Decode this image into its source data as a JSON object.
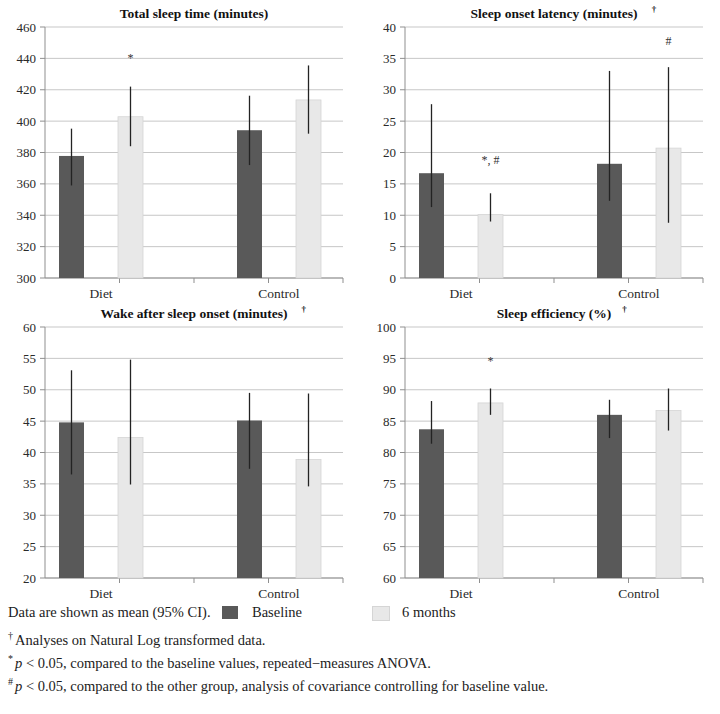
{
  "figure": {
    "colors": {
      "baseline": "#595959",
      "six_months": "#e8e8e8",
      "six_months_stroke": "#d5d5d5",
      "error_bar": "#232323",
      "gridline": "#b9b9b9"
    },
    "group_labels": [
      "Diet",
      "Control"
    ],
    "legend": {
      "lead_text": "Data are shown as mean (95% CI).",
      "baseline_label": "Baseline",
      "six_months_label": "6 months"
    },
    "notes": [
      {
        "marker": "†",
        "text": "Analyses on Natural Log transformed data."
      },
      {
        "marker": "*",
        "text": "p < 0.05, compared to the baseline values, repeated−measures ANOVA.",
        "italic_prefix": "p"
      },
      {
        "marker": "#",
        "text": "p < 0.05, compared to the other group, analysis of covariance controlling for baseline value.",
        "italic_prefix": "p"
      }
    ]
  },
  "chart_data": [
    {
      "type": "bar",
      "title": "Total sleep time (minutes)",
      "title_dagger": "",
      "xlabel": "",
      "ylabel": "",
      "ylim": [
        300,
        460
      ],
      "ytick_step": 20,
      "yticks": [
        300,
        320,
        340,
        360,
        380,
        400,
        420,
        440,
        460
      ],
      "grid": true,
      "categories": [
        "Diet",
        "Control"
      ],
      "series": [
        {
          "name": "Baseline",
          "values": [
            377.8,
            394.2
          ],
          "ci_low": [
            359.0,
            372.0
          ],
          "ci_high": [
            395.2,
            416.2
          ]
        },
        {
          "name": "6 months",
          "values": [
            402.8,
            413.5
          ],
          "ci_low": [
            384.0,
            392.0
          ],
          "ci_high": [
            422.0,
            435.5
          ]
        }
      ],
      "annotations": [
        {
          "series": "6 months",
          "category": "Diet",
          "text": "*",
          "y": 438
        }
      ]
    },
    {
      "type": "bar",
      "title": "Sleep onset latency (minutes)",
      "title_dagger": "†",
      "xlabel": "",
      "ylabel": "",
      "ylim": [
        0,
        40
      ],
      "ytick_step": 5,
      "yticks": [
        0,
        5,
        10,
        15,
        20,
        25,
        30,
        35,
        40
      ],
      "grid": true,
      "categories": [
        "Diet",
        "Control"
      ],
      "series": [
        {
          "name": "Baseline",
          "values": [
            16.7,
            18.2
          ],
          "ci_low": [
            11.3,
            12.3
          ],
          "ci_high": [
            27.7,
            33.0
          ]
        },
        {
          "name": "6 months",
          "values": [
            10.1,
            20.7
          ],
          "ci_low": [
            9.0,
            8.8
          ],
          "ci_high": [
            13.5,
            33.6
          ]
        }
      ],
      "annotations": [
        {
          "series": "6 months",
          "category": "Diet",
          "text": "*, #",
          "y": 18.2
        },
        {
          "series": "6 months",
          "category": "Control",
          "text": "#",
          "y": 37.2
        }
      ]
    },
    {
      "type": "bar",
      "title": "Wake after sleep onset (minutes)",
      "title_dagger": "†",
      "xlabel": "",
      "ylabel": "",
      "ylim": [
        20,
        60
      ],
      "ytick_step": 5,
      "yticks": [
        20,
        25,
        30,
        35,
        40,
        45,
        50,
        55,
        60
      ],
      "grid": true,
      "categories": [
        "Diet",
        "Control"
      ],
      "series": [
        {
          "name": "Baseline",
          "values": [
            44.8,
            45.1
          ],
          "ci_low": [
            36.5,
            37.4
          ],
          "ci_high": [
            53.1,
            49.5
          ]
        },
        {
          "name": "6 months",
          "values": [
            42.4,
            38.9
          ],
          "ci_low": [
            34.9,
            34.6
          ],
          "ci_high": [
            54.8,
            49.4
          ]
        }
      ],
      "annotations": []
    },
    {
      "type": "bar",
      "title": "Sleep efficiency (%)",
      "title_dagger": "†",
      "xlabel": "",
      "ylabel": "",
      "ylim": [
        60,
        100
      ],
      "ytick_step": 5,
      "yticks": [
        60,
        65,
        70,
        75,
        80,
        85,
        90,
        95,
        100
      ],
      "grid": true,
      "categories": [
        "Diet",
        "Control"
      ],
      "series": [
        {
          "name": "Baseline",
          "values": [
            83.7,
            86.0
          ],
          "ci_low": [
            81.4,
            82.3
          ],
          "ci_high": [
            88.2,
            88.4
          ]
        },
        {
          "name": "6 months",
          "values": [
            87.9,
            86.7
          ],
          "ci_low": [
            86.0,
            83.5
          ],
          "ci_high": [
            90.2,
            90.2
          ]
        }
      ],
      "annotations": [
        {
          "series": "6 months",
          "category": "Diet",
          "text": "*",
          "y": 94.0
        }
      ]
    }
  ]
}
